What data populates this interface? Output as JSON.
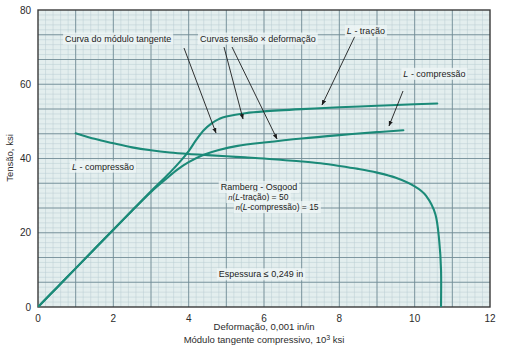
{
  "chart_data": {
    "type": "line",
    "title": "",
    "xlabel": "Deformação, 0,001 in/in",
    "xlabel2": "Módulo tangente compressivo, 10³ ksi",
    "ylabel": "Tensão, ksi",
    "xlim": [
      0,
      12
    ],
    "ylim": [
      0,
      80
    ],
    "xticks": [
      "0",
      "2",
      "4",
      "6",
      "8",
      "10",
      "12"
    ],
    "yticks": [
      "0",
      "20",
      "40",
      "60",
      "80"
    ],
    "grid": "minor grid every 0.2 x-units and 1.333 ksi; major grid every 1 x-unit and 6.667 ksi",
    "legend_position": "inline annotations with leader lines",
    "accent_color": "#1b8a78",
    "grid_minor_color": "#b9ccd2",
    "grid_major_color": "#6f8a94",
    "plot_bg": "#e3eeee",
    "series": [
      {
        "name": "Curva do módulo tangente (L - compressão)",
        "annotation": "Curva do módulo tangente",
        "points": [
          [
            1.0,
            46.8
          ],
          [
            1.5,
            45.3
          ],
          [
            2.0,
            44.1
          ],
          [
            2.5,
            43.0
          ],
          [
            3.0,
            42.2
          ],
          [
            3.5,
            41.6
          ],
          [
            4.0,
            41.2
          ],
          [
            4.5,
            40.9
          ],
          [
            5.0,
            40.6
          ],
          [
            5.5,
            40.3
          ],
          [
            6.0,
            40.0
          ],
          [
            6.5,
            39.6
          ],
          [
            7.0,
            39.2
          ],
          [
            7.5,
            38.7
          ],
          [
            8.0,
            38.0
          ],
          [
            8.5,
            37.2
          ],
          [
            9.0,
            36.2
          ],
          [
            9.5,
            34.8
          ],
          [
            10.0,
            32.5
          ],
          [
            10.3,
            30.0
          ],
          [
            10.55,
            25.0
          ],
          [
            10.65,
            18.0
          ],
          [
            10.7,
            10.0
          ],
          [
            10.7,
            0.0
          ]
        ]
      },
      {
        "name": "L - tração (tensão × deformação)",
        "annotation": "L - tração",
        "points": [
          [
            0.0,
            0.0
          ],
          [
            0.5,
            5.2
          ],
          [
            1.0,
            10.4
          ],
          [
            1.5,
            15.6
          ],
          [
            2.0,
            20.8
          ],
          [
            2.5,
            26.0
          ],
          [
            3.0,
            31.2
          ],
          [
            3.5,
            36.2
          ],
          [
            3.8,
            39.5
          ],
          [
            4.0,
            42.0
          ],
          [
            4.2,
            45.0
          ],
          [
            4.4,
            47.6
          ],
          [
            4.6,
            49.4
          ],
          [
            4.8,
            50.6
          ],
          [
            5.0,
            51.3
          ],
          [
            5.5,
            52.2
          ],
          [
            6.0,
            52.7
          ],
          [
            7.0,
            53.3
          ],
          [
            8.0,
            53.8
          ],
          [
            9.0,
            54.2
          ],
          [
            10.0,
            54.6
          ],
          [
            10.6,
            54.8
          ]
        ]
      },
      {
        "name": "L - compressão (tensão × deformação)",
        "annotation": "L - compressão",
        "points": [
          [
            0.0,
            0.0
          ],
          [
            0.5,
            5.2
          ],
          [
            1.0,
            10.4
          ],
          [
            1.5,
            15.6
          ],
          [
            2.0,
            20.8
          ],
          [
            2.5,
            26.0
          ],
          [
            3.0,
            31.0
          ],
          [
            3.4,
            34.5
          ],
          [
            3.7,
            37.0
          ],
          [
            4.0,
            39.0
          ],
          [
            4.4,
            41.0
          ],
          [
            4.8,
            42.3
          ],
          [
            5.3,
            43.4
          ],
          [
            6.0,
            44.3
          ],
          [
            7.0,
            45.4
          ],
          [
            8.0,
            46.3
          ],
          [
            9.0,
            47.1
          ],
          [
            9.7,
            47.6
          ]
        ]
      }
    ],
    "annotations": [
      {
        "id": "tangent-modulus-note",
        "text": "Curva do módulo tangente",
        "x": 0.72,
        "y": 71.5
      },
      {
        "id": "stress-strain-note",
        "text": "Curvas tensão × deformação",
        "x": 4.3,
        "y": 71.5
      },
      {
        "id": "l-tracao-note",
        "text": "L - tração",
        "x": 8.2,
        "y": 73.5
      },
      {
        "id": "l-compressao-right-note",
        "text": "L - compressão",
        "x": 9.7,
        "y": 62.0
      },
      {
        "id": "l-compressao-left-note",
        "text": "L - compressão",
        "x": 0.9,
        "y": 37.0
      },
      {
        "id": "ramberg-title",
        "text": "Ramberg - Osgood",
        "x": 4.85,
        "y": 31.5
      },
      {
        "id": "ramberg-n-tracao",
        "text": "n(L-tração) = 50",
        "x": 5.05,
        "y": 28.8
      },
      {
        "id": "ramberg-n-compressao",
        "text": "n(L-compressão) = 15",
        "x": 5.25,
        "y": 26.1
      },
      {
        "id": "thickness-note",
        "text": "Espessura ≤ 0,249 in",
        "x": 4.8,
        "y": 8.0
      }
    ]
  }
}
